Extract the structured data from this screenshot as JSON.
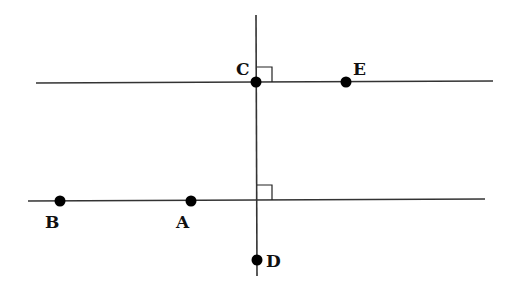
{
  "diagram": {
    "type": "geometry",
    "lines": [
      {
        "name": "top-line",
        "x1": 36,
        "y1": 83,
        "x2": 493,
        "y2": 81
      },
      {
        "name": "bottom-line",
        "x1": 28,
        "y1": 201,
        "x2": 485,
        "y2": 199
      },
      {
        "name": "transversal",
        "x1": 256,
        "y1": 15,
        "x2": 257,
        "y2": 276
      }
    ],
    "right_angles": [
      {
        "at": "C",
        "x": 257,
        "y": 67,
        "size": 15
      },
      {
        "at": "bottom-intersection",
        "x": 257,
        "y": 185,
        "size": 15
      }
    ],
    "points": [
      {
        "label": "C",
        "x": 256,
        "y": 82,
        "lx": 236,
        "ly": 75
      },
      {
        "label": "E",
        "x": 346,
        "y": 82,
        "lx": 353,
        "ly": 75
      },
      {
        "label": "B",
        "x": 60,
        "y": 201,
        "lx": 45,
        "ly": 228
      },
      {
        "label": "A",
        "x": 191,
        "y": 201,
        "lx": 176,
        "ly": 228
      },
      {
        "label": "D",
        "x": 257,
        "y": 260,
        "lx": 266,
        "ly": 267
      }
    ]
  }
}
